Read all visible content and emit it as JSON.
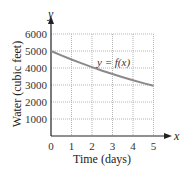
{
  "chart_data": {
    "type": "line",
    "title": "",
    "xlabel": "Time (days)",
    "ylabel": "Water (cubic feet)",
    "x_axis_symbol": "x",
    "y_axis_symbol": "y",
    "curve_label": "y = f(x)",
    "xlim": [
      0,
      5
    ],
    "ylim": [
      0,
      6000
    ],
    "x_ticks": [
      0,
      1,
      2,
      3,
      4,
      5
    ],
    "y_ticks": [
      1000,
      2000,
      3000,
      4000,
      5000,
      6000
    ],
    "grid": true,
    "series": [
      {
        "name": "y = f(x)",
        "x": [
          0,
          0.5,
          1,
          1.5,
          2,
          2.5,
          3,
          3.5,
          4,
          4.5,
          5
        ],
        "values": [
          5000,
          4743,
          4500,
          4269,
          4050,
          3842,
          3645,
          3458,
          3281,
          3113,
          2950
        ]
      }
    ],
    "colors": {
      "curve": "#8a8a8a",
      "grid": "#b5b5b5",
      "axis": "#222222"
    }
  }
}
